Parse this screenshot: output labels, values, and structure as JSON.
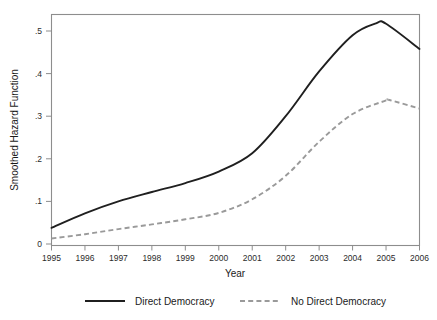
{
  "chart_data": {
    "type": "line",
    "title": "",
    "xlabel": "Year",
    "ylabel": "Smoothed Hazard Function",
    "x": [
      1995,
      1996,
      1997,
      1998,
      1999,
      2000,
      2001,
      2002,
      2003,
      2004,
      2005,
      2006
    ],
    "xtick_labels": [
      "1995",
      "1996",
      "1997",
      "1998",
      "1999",
      "2000",
      "2001",
      "2002",
      "2003",
      "2004",
      "2005",
      "2006"
    ],
    "ytick_labels": [
      "0",
      ".1",
      ".2",
      ".3",
      ".4",
      ".5"
    ],
    "ytick_values": [
      0,
      0.1,
      0.2,
      0.3,
      0.4,
      0.5
    ],
    "xlim": [
      1995,
      2006
    ],
    "ylim": [
      0,
      0.53
    ],
    "grid": false,
    "legend_position": "bottom",
    "series": [
      {
        "name": "Direct Democracy",
        "style": "solid",
        "color": "#1f1f1f",
        "values": [
          0.038,
          0.072,
          0.1,
          0.122,
          0.143,
          0.17,
          0.213,
          0.3,
          0.405,
          0.49,
          0.517,
          0.458
        ],
        "peak_x": 2004.7,
        "peak_y": 0.518
      },
      {
        "name": "No Direct Democracy",
        "style": "dashed",
        "color": "#9a9a9a",
        "values": [
          0.013,
          0.023,
          0.035,
          0.046,
          0.058,
          0.073,
          0.105,
          0.16,
          0.24,
          0.305,
          0.337,
          0.318
        ],
        "peak_x": 2005.1,
        "peak_y": 0.338
      }
    ]
  },
  "legend": {
    "entries": [
      {
        "label": "Direct Democracy",
        "style": "solid",
        "color": "#1f1f1f"
      },
      {
        "label": "No Direct Democracy",
        "style": "dashed",
        "color": "#9a9a9a"
      }
    ]
  }
}
